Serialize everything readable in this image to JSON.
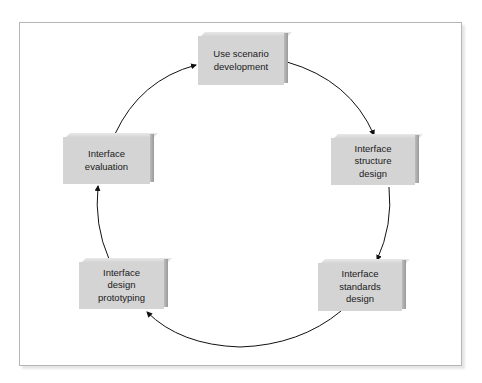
{
  "diagram": {
    "type": "cycle",
    "nodes": [
      {
        "id": "use_scenario",
        "label": "Use scenario\ndevelopment"
      },
      {
        "id": "structure",
        "label": "Interface\nstructure\ndesign"
      },
      {
        "id": "standards",
        "label": "Interface\nstandards\ndesign"
      },
      {
        "id": "prototyping",
        "label": "Interface\ndesign\nprototyping"
      },
      {
        "id": "evaluation",
        "label": "Interface\nevaluation"
      }
    ],
    "edges": [
      {
        "from": "use_scenario",
        "to": "structure"
      },
      {
        "from": "structure",
        "to": "standards"
      },
      {
        "from": "standards",
        "to": "prototyping"
      },
      {
        "from": "prototyping",
        "to": "evaluation"
      },
      {
        "from": "evaluation",
        "to": "use_scenario"
      }
    ],
    "colors": {
      "box_face": "#d4d4d4",
      "box_side": "#a8a8a8",
      "arrow": "#111111",
      "frame": "#b5b5b5"
    }
  }
}
